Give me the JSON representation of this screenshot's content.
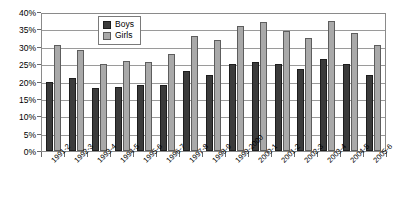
{
  "chart_data": {
    "type": "bar",
    "title": "",
    "xlabel": "",
    "ylabel": "",
    "ylim": [
      0,
      40
    ],
    "ytick_step": 5,
    "grid": true,
    "legend_position": "top-center",
    "categories": [
      "1991-2",
      "1992-3",
      "1993-4",
      "1994-5",
      "1995-6",
      "1996-7",
      "1997-8",
      "1998-9",
      "1999-2000",
      "2000-1",
      "2001-2",
      "2002-3",
      "2003-4",
      "2004-5",
      "2005-6"
    ],
    "ytick_labels": [
      "0%",
      "5%",
      "10%",
      "15%",
      "20%",
      "25%",
      "30%",
      "35%",
      "40%"
    ],
    "series": [
      {
        "name": "Boys",
        "color": "#3b3b3b",
        "values": [
          20,
          21,
          18,
          18.5,
          19,
          19,
          23,
          22,
          25,
          25.5,
          25,
          23.5,
          26.5,
          25,
          22
        ]
      },
      {
        "name": "Girls",
        "color": "#a9a9a9",
        "values": [
          30.5,
          29,
          25,
          26,
          25.5,
          28,
          33,
          32,
          36,
          37,
          34.5,
          32.5,
          37.5,
          34,
          30.5
        ]
      }
    ]
  },
  "legend": {
    "items": [
      {
        "label": "Boys",
        "swatch": "boys"
      },
      {
        "label": "Girls",
        "swatch": "girls"
      }
    ]
  }
}
